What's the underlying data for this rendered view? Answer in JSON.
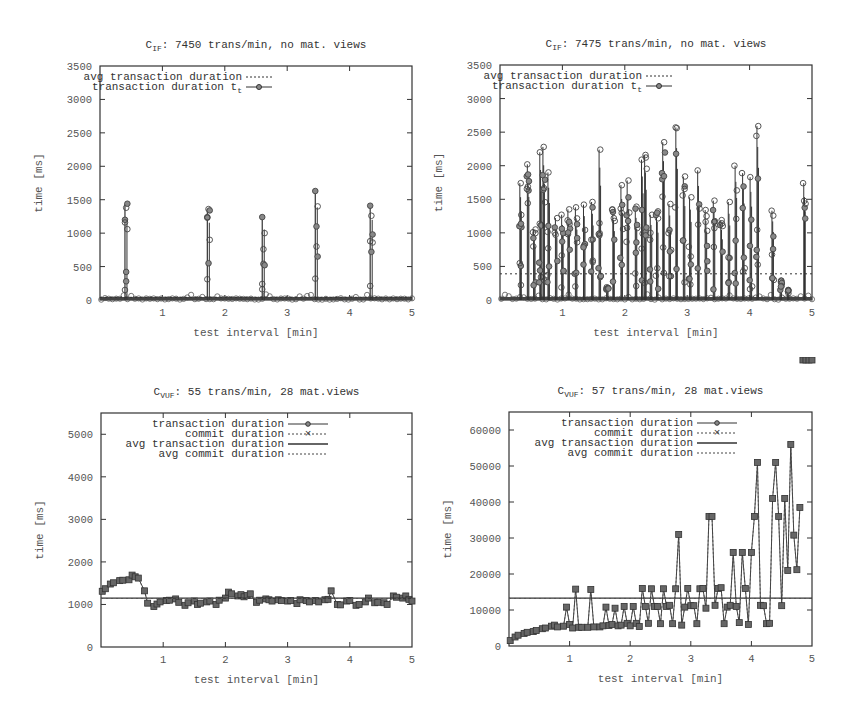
{
  "charts": [
    {
      "id": "top-left",
      "title_main": "C",
      "title_sub": "IF",
      "title_rest": ": 7450 trans/min, no mat. views",
      "xlabel": "test interval [min]",
      "ylabel": "time [ms]",
      "yticks": [
        "0",
        "500",
        "1000",
        "1500",
        "2000",
        "2500",
        "3000",
        "3500"
      ],
      "xticks": [
        "1",
        "2",
        "3",
        "4",
        "5"
      ],
      "legend": [
        "avg transaction duration",
        "transaction duration t"
      ],
      "legend_sub": "t"
    },
    {
      "id": "top-right",
      "title_main": "C",
      "title_sub": "IF",
      "title_rest": ": 7475 trans/min, no mat. views",
      "xlabel": "test interval [min]",
      "ylabel": "time [ms]",
      "yticks": [
        "0",
        "500",
        "1000",
        "1500",
        "2000",
        "2500",
        "3000",
        "3500"
      ],
      "xticks": [
        "1",
        "2",
        "3",
        "4",
        "5"
      ],
      "legend": [
        "avg transaction duration",
        "transaction duration t"
      ],
      "legend_sub": "t"
    },
    {
      "id": "bottom-left",
      "title_main": "C",
      "title_sub": "VUF",
      "title_rest": ": 55 trans/min, 28 mat.views",
      "xlabel": "test interval [min]",
      "ylabel": "time [ms]",
      "yticks": [
        "0",
        "1000",
        "2000",
        "3000",
        "4000",
        "5000"
      ],
      "xticks": [
        "1",
        "2",
        "3",
        "4",
        "5"
      ],
      "legend": [
        "transaction duration",
        "commit duration",
        "avg transaction duration",
        "avg commit duration"
      ]
    },
    {
      "id": "bottom-right",
      "title_main": "C",
      "title_sub": "VUF",
      "title_rest": ": 57 trans/min, 28 mat.views",
      "xlabel": "test interval [min]",
      "ylabel": "time [ms]",
      "yticks": [
        "0",
        "10000",
        "20000",
        "30000",
        "40000",
        "50000",
        "60000"
      ],
      "xticks": [
        "1",
        "2",
        "3",
        "4",
        "5"
      ],
      "legend": [
        "transaction duration",
        "commit duration",
        "avg transaction duration",
        "avg commit duration"
      ]
    }
  ],
  "chart_data": [
    {
      "type": "line",
      "title": "C_IF: 7450 trans/min, no mat. views",
      "xlabel": "test interval [min]",
      "ylabel": "time [ms]",
      "xlim": [
        0,
        5
      ],
      "ylim": [
        0,
        3500
      ],
      "grid": false,
      "legend_position": "top-left inside",
      "series": [
        {
          "name": "avg transaction duration",
          "style": "dotted",
          "values": [
            40
          ]
        },
        {
          "name": "transaction duration t_t",
          "style": "line+circle",
          "note": "baseline ~0-80 ms with bursts",
          "spikes": [
            {
              "x": 0.4,
              "values": [
                150,
                420,
                1060,
                1200,
                1380,
                1440,
                1160,
                280
              ]
            },
            {
              "x": 1.72,
              "values": [
                310,
                550,
                900,
                1240,
                1360,
                1340,
                1230
              ]
            },
            {
              "x": 2.6,
              "values": [
                240,
                540,
                1000,
                1240,
                760,
                520,
                160
              ]
            },
            {
              "x": 3.45,
              "values": [
                320,
                1100,
                1400,
                1630,
                800,
                650
              ]
            },
            {
              "x": 4.33,
              "values": [
                210,
                720,
                860,
                1410,
                1260,
                980,
                880
              ]
            }
          ]
        }
      ]
    },
    {
      "type": "line",
      "title": "C_IF: 7475 trans/min, no mat. views",
      "xlabel": "test interval [min]",
      "ylabel": "time [ms]",
      "xlim": [
        0,
        5
      ],
      "ylim": [
        0,
        3500
      ],
      "grid": false,
      "legend_position": "top-left inside",
      "series": [
        {
          "name": "avg transaction duration",
          "style": "dotted",
          "values": [
            390
          ]
        },
        {
          "name": "transaction duration t_t",
          "style": "line+circle",
          "note": "dense bursts, peaks listed",
          "peaks": [
            {
              "x": 0.33,
              "y": 1740
            },
            {
              "x": 0.45,
              "y": 2020
            },
            {
              "x": 0.55,
              "y": 1050
            },
            {
              "x": 0.65,
              "y": 2200
            },
            {
              "x": 0.7,
              "y": 2280
            },
            {
              "x": 0.78,
              "y": 1900
            },
            {
              "x": 0.9,
              "y": 1220
            },
            {
              "x": 1.0,
              "y": 1270
            },
            {
              "x": 1.1,
              "y": 1350
            },
            {
              "x": 1.22,
              "y": 1380
            },
            {
              "x": 1.35,
              "y": 1420
            },
            {
              "x": 1.48,
              "y": 1460
            },
            {
              "x": 1.6,
              "y": 2240
            },
            {
              "x": 1.72,
              "y": 190
            },
            {
              "x": 1.82,
              "y": 1350
            },
            {
              "x": 1.95,
              "y": 1710
            },
            {
              "x": 2.05,
              "y": 1780
            },
            {
              "x": 2.18,
              "y": 1390
            },
            {
              "x": 2.28,
              "y": 2090
            },
            {
              "x": 2.33,
              "y": 2160
            },
            {
              "x": 2.42,
              "y": 1270
            },
            {
              "x": 2.52,
              "y": 1320
            },
            {
              "x": 2.62,
              "y": 2350
            },
            {
              "x": 2.72,
              "y": 1430
            },
            {
              "x": 2.83,
              "y": 2570
            },
            {
              "x": 2.95,
              "y": 1840
            },
            {
              "x": 3.05,
              "y": 1530
            },
            {
              "x": 3.18,
              "y": 1930
            },
            {
              "x": 3.3,
              "y": 1340
            },
            {
              "x": 3.43,
              "y": 1480
            },
            {
              "x": 3.55,
              "y": 1190
            },
            {
              "x": 3.67,
              "y": 1460
            },
            {
              "x": 3.78,
              "y": 2000
            },
            {
              "x": 3.9,
              "y": 1890
            },
            {
              "x": 4.02,
              "y": 1830
            },
            {
              "x": 4.13,
              "y": 2590
            },
            {
              "x": 4.37,
              "y": 1330
            },
            {
              "x": 4.5,
              "y": 290
            },
            {
              "x": 4.62,
              "y": 100
            },
            {
              "x": 4.88,
              "y": 1740
            }
          ]
        }
      ]
    },
    {
      "type": "line",
      "title": "C_VUF: 55 trans/min, 28 mat.views",
      "xlabel": "test interval [min]",
      "ylabel": "time [ms]",
      "xlim": [
        0,
        5
      ],
      "ylim": [
        0,
        5500
      ],
      "grid": false,
      "legend_position": "top-right inside",
      "x": [
        0.02,
        0.07,
        0.15,
        0.2,
        0.3,
        0.35,
        0.45,
        0.5,
        0.55,
        0.6,
        0.7,
        0.75,
        0.85,
        0.9,
        0.95,
        1.05,
        1.1,
        1.2,
        1.25,
        1.35,
        1.4,
        1.5,
        1.55,
        1.6,
        1.7,
        1.75,
        1.85,
        1.9,
        2.0,
        2.05,
        2.1,
        2.2,
        2.25,
        2.3,
        2.35,
        2.4,
        2.5,
        2.55,
        2.65,
        2.7,
        2.75,
        2.85,
        2.9,
        3.0,
        3.05,
        3.15,
        3.2,
        3.3,
        3.35,
        3.45,
        3.5,
        3.6,
        3.65,
        3.7,
        3.8,
        3.85,
        3.95,
        4.0,
        4.1,
        4.15,
        4.25,
        4.3,
        4.4,
        4.45,
        4.55,
        4.6,
        4.7,
        4.75,
        4.85,
        4.9,
        4.95,
        5.0
      ],
      "series": [
        {
          "name": "transaction duration",
          "style": "line+circle",
          "values": [
            1310,
            1370,
            1480,
            1510,
            1560,
            1570,
            1580,
            1690,
            1650,
            1620,
            1320,
            1030,
            950,
            1010,
            1060,
            1090,
            1100,
            1130,
            1050,
            980,
            1040,
            1080,
            1000,
            1030,
            1060,
            1080,
            1000,
            1100,
            1150,
            1290,
            1250,
            1200,
            1230,
            1180,
            1210,
            1250,
            1050,
            1100,
            1130,
            1110,
            1080,
            1110,
            1090,
            1080,
            1090,
            1020,
            1110,
            1090,
            1060,
            1090,
            1060,
            1110,
            1120,
            1320,
            1000,
            990,
            1080,
            1090,
            980,
            1000,
            1060,
            1150,
            1040,
            1050,
            1040,
            1000,
            1200,
            1170,
            1150,
            1200,
            1120,
            1080
          ]
        },
        {
          "name": "commit duration",
          "style": "dashed+cross",
          "values": [
            1300,
            1360,
            1470,
            1500,
            1550,
            1560,
            1570,
            1680,
            1640,
            1610,
            1310,
            1020,
            940,
            1000,
            1050,
            1080,
            1090,
            1120,
            1040,
            970,
            1030,
            1070,
            990,
            1020,
            1050,
            1070,
            990,
            1090,
            1140,
            1280,
            1240,
            1190,
            1220,
            1170,
            1200,
            1240,
            1040,
            1090,
            1120,
            1100,
            1070,
            1100,
            1080,
            1070,
            1080,
            1010,
            1100,
            1080,
            1050,
            1080,
            1050,
            1100,
            1110,
            1310,
            990,
            980,
            1070,
            1080,
            970,
            990,
            1050,
            1140,
            1030,
            1040,
            1030,
            990,
            1190,
            1160,
            1140,
            1190,
            1110,
            1070
          ]
        },
        {
          "name": "avg transaction duration",
          "style": "solid",
          "values": [
            1150
          ]
        },
        {
          "name": "avg commit duration",
          "style": "dotted",
          "values": [
            1140
          ]
        }
      ]
    },
    {
      "type": "line",
      "title": "C_VUF: 57 trans/min, 28 mat.views",
      "xlabel": "test interval [min]",
      "ylabel": "time [ms]",
      "xlim": [
        0,
        5
      ],
      "ylim": [
        0,
        65000
      ],
      "grid": false,
      "legend_position": "top-right inside",
      "x": [
        0.02,
        0.1,
        0.15,
        0.25,
        0.3,
        0.4,
        0.45,
        0.55,
        0.6,
        0.7,
        0.75,
        0.8,
        0.9,
        0.95,
        1.0,
        1.05,
        1.1,
        1.15,
        1.2,
        1.3,
        1.35,
        1.4,
        1.5,
        1.55,
        1.6,
        1.65,
        1.7,
        1.75,
        1.8,
        1.85,
        1.9,
        1.95,
        2.0,
        2.05,
        2.1,
        2.15,
        2.2,
        2.25,
        2.3,
        2.35,
        2.4,
        2.45,
        2.5,
        2.55,
        2.6,
        2.65,
        2.7,
        2.75,
        2.8,
        2.85,
        2.9,
        2.95,
        3.0,
        3.05,
        3.1,
        3.15,
        3.2,
        3.25,
        3.3,
        3.35,
        3.4,
        3.45,
        3.5,
        3.55,
        3.6,
        3.65,
        3.7,
        3.75,
        3.8,
        3.85,
        3.9,
        3.95,
        4.0,
        4.05,
        4.1,
        4.15,
        4.2,
        4.25,
        4.3,
        4.35,
        4.4,
        4.45,
        4.5,
        4.55,
        4.6,
        4.65,
        4.7,
        4.75,
        4.8,
        4.85,
        4.9,
        4.95,
        5.0
      ],
      "series": [
        {
          "name": "transaction duration",
          "style": "line+circle",
          "values": [
            1500,
            2500,
            3000,
            3500,
            3800,
            4000,
            4300,
            4800,
            5000,
            5500,
            5800,
            5300,
            5500,
            10800,
            6000,
            5000,
            15800,
            5200,
            5200,
            5200,
            15700,
            5300,
            5300,
            5600,
            10800,
            5700,
            6000,
            10500,
            5600,
            5800,
            11000,
            6300,
            5600,
            11000,
            6300,
            5400,
            16000,
            11000,
            6300,
            15900,
            11000,
            11000,
            6200,
            15900,
            11000,
            11300,
            6200,
            15900,
            31000,
            5800,
            10800,
            16000,
            11200,
            11200,
            6200,
            15900,
            16000,
            10500,
            36000,
            36000,
            11300,
            16000,
            16200,
            6200,
            10800,
            11300,
            26000,
            11000,
            6500,
            26000,
            16000,
            6000,
            26000,
            36000,
            51000,
            11300,
            11200,
            6200,
            6300,
            41000,
            51000,
            36000,
            11200,
            41000,
            21000,
            56000,
            30800,
            21200,
            38500
          ]
        },
        {
          "name": "commit duration",
          "style": "dashed+cross",
          "values": [
            1500,
            2500,
            3000,
            3500,
            3800,
            4000,
            4300,
            4800,
            5000,
            5500,
            5800,
            5300,
            5500,
            10800,
            6000,
            5000,
            15800,
            5200,
            5200,
            5200,
            15700,
            5300,
            5300,
            5600,
            10800,
            5700,
            6000,
            10500,
            5600,
            5800,
            11000,
            6300,
            5600,
            11000,
            6300,
            5400,
            16000,
            11000,
            6300,
            15900,
            11000,
            11000,
            6200,
            15900,
            11000,
            11300,
            6200,
            15900,
            31000,
            5800,
            10800,
            16000,
            11200,
            11200,
            6200,
            15900,
            16000,
            10500,
            36000,
            36000,
            11300,
            16000,
            16200,
            6200,
            10800,
            11300,
            26000,
            11000,
            6500,
            26000,
            16000,
            6000,
            26000,
            36000,
            51000,
            11300,
            11200,
            6200,
            6300,
            41000,
            51000,
            36000,
            11200,
            41000,
            21000,
            56000,
            30800,
            21200,
            38500
          ]
        },
        {
          "name": "avg transaction duration",
          "style": "solid",
          "values": [
            13300
          ]
        },
        {
          "name": "avg commit duration",
          "style": "dotted",
          "values": [
            13200
          ]
        }
      ]
    }
  ]
}
